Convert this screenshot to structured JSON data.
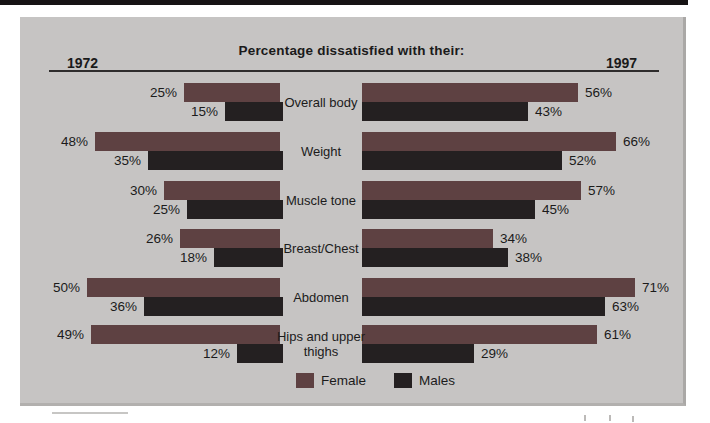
{
  "header": {
    "title": "Percentage dissatisfied with their:",
    "left_year": "1972",
    "right_year": "1997"
  },
  "legend": {
    "female_label": "Female",
    "males_label": "Males"
  },
  "colors": {
    "female_bar": "#5e4142",
    "male_bar": "#242021",
    "panel_bg": "#c6c4c3",
    "page_bg": "#ffffff",
    "header_line": "#2e2c2c",
    "top_bar": "#161314",
    "text": "#1b1b1b"
  },
  "chart_data": {
    "type": "bar",
    "orientation": "horizontal-paired-pyramid",
    "title": "Percentage dissatisfied with their:",
    "value_suffix": "%",
    "xlim_percent": [
      0,
      75
    ],
    "grid": false,
    "legend_position": "bottom-center",
    "categories": [
      "Overall body",
      "Weight",
      "Muscle tone",
      "Breast/Chest",
      "Abdomen",
      "Hips and upper thighs"
    ],
    "series": [
      {
        "name": "1972 Female",
        "year": "1972",
        "group": "Female",
        "values": [
          25,
          48,
          30,
          26,
          50,
          49
        ]
      },
      {
        "name": "1972 Males",
        "year": "1972",
        "group": "Males",
        "values": [
          15,
          35,
          25,
          18,
          36,
          12
        ]
      },
      {
        "name": "1997 Female",
        "year": "1997",
        "group": "Female",
        "values": [
          56,
          66,
          57,
          34,
          71,
          61
        ]
      },
      {
        "name": "1997 Males",
        "year": "1997",
        "group": "Males",
        "values": [
          43,
          52,
          45,
          38,
          63,
          29
        ]
      }
    ]
  }
}
